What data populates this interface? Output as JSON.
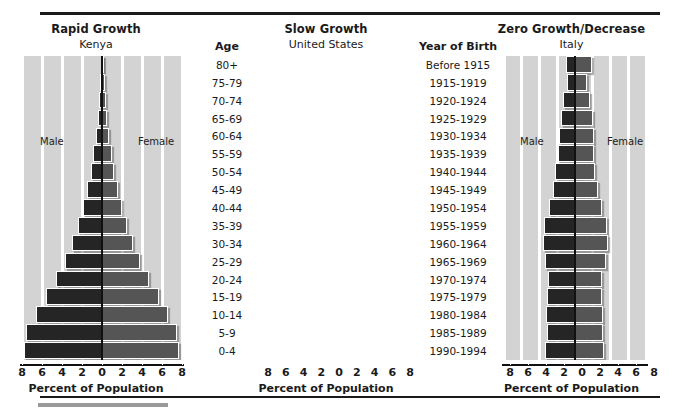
{
  "chart_data": {
    "type": "bar",
    "xlabel": "Percent of Population",
    "ylabel": "Age",
    "xlim": [
      -8,
      8
    ],
    "xticks": [
      "8",
      "6",
      "4",
      "2",
      "0",
      "2",
      "4",
      "6",
      "8"
    ],
    "grid": true,
    "legend_position": "inside-panel",
    "categories": [
      "80+",
      "75-79",
      "70-74",
      "65-69",
      "60-64",
      "55-59",
      "50-54",
      "45-49",
      "40-44",
      "35-39",
      "30-34",
      "25-29",
      "20-24",
      "15-19",
      "10-14",
      "5-9",
      "0-4"
    ],
    "year_of_birth": [
      "Before 1915",
      "1915-1919",
      "1920-1924",
      "1925-1929",
      "1930-1934",
      "1935-1939",
      "1940-1944",
      "1945-1949",
      "1950-1954",
      "1955-1959",
      "1960-1964",
      "1965-1969",
      "1970-1974",
      "1975-1979",
      "1980-1984",
      "1985-1989",
      "1990-1994"
    ],
    "panels": [
      {
        "title": "Rapid Growth",
        "subtitle": "Kenya",
        "male_label": "Male",
        "female_label": "Female",
        "series": [
          {
            "name": "Male",
            "values": [
              0.15,
              0.2,
              0.3,
              0.45,
              0.65,
              0.9,
              1.15,
              1.5,
              1.9,
              2.4,
              3.0,
              3.7,
              4.6,
              5.6,
              6.6,
              7.6,
              7.8
            ]
          },
          {
            "name": "Female",
            "values": [
              0.2,
              0.25,
              0.35,
              0.5,
              0.7,
              0.95,
              1.2,
              1.55,
              1.95,
              2.45,
              3.05,
              3.75,
              4.65,
              5.65,
              6.6,
              7.5,
              7.7
            ]
          }
        ]
      },
      {
        "title": "Slow Growth",
        "subtitle": "United States",
        "male_label": "Male",
        "female_label": "Female",
        "series": [
          {
            "name": "Male",
            "values": [
              1.0,
              0.9,
              1.3,
              1.6,
              1.8,
              1.9,
              2.2,
              2.5,
              2.9,
              3.5,
              3.6,
              3.4,
              3.0,
              3.1,
              3.3,
              3.2,
              3.4
            ]
          },
          {
            "name": "Female",
            "values": [
              1.9,
              1.3,
              1.7,
              2.0,
              2.1,
              2.1,
              2.3,
              2.6,
              3.0,
              3.6,
              3.7,
              3.5,
              3.0,
              3.0,
              3.2,
              3.1,
              3.3
            ]
          }
        ]
      },
      {
        "title": "Zero Growth/Decrease",
        "subtitle": "Italy",
        "male_label": "Male",
        "female_label": "Female",
        "series": [
          {
            "name": "Male",
            "values": [
              1.4,
              0.7,
              1.9,
              1.6,
              2.1,
              2.4,
              2.2,
              2.9,
              3.0,
              2.8,
              3.4,
              3.5,
              3.4,
              3.0,
              2.4,
              1.9,
              1.7
            ]
          },
          {
            "name": "Female",
            "values": [
              2.2,
              0.9,
              2.1,
              1.9,
              2.3,
              2.6,
              2.4,
              3.0,
              3.1,
              2.9,
              3.5,
              3.6,
              3.5,
              3.1,
              2.5,
              2.0,
              1.8
            ]
          }
        ]
      }
    ]
  },
  "columns": {
    "age": {
      "header": "Age"
    },
    "yob": {
      "header": "Year of Birth"
    }
  }
}
